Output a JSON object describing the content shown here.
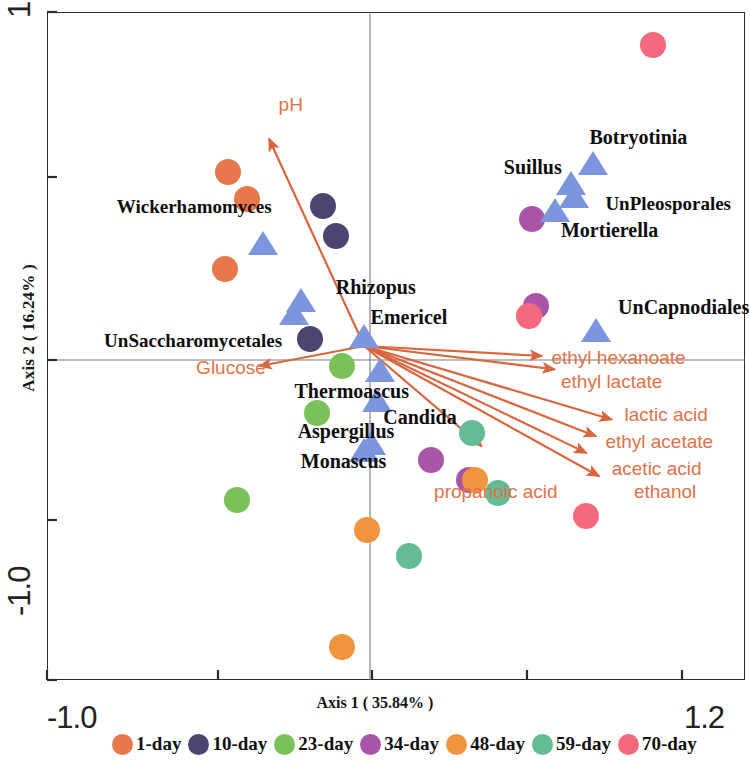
{
  "axes": {
    "x_title": "Axis 1 ( 35.84% )",
    "y_title": "Axis 2 ( 16.24% )",
    "x_min_label": "-1.0",
    "x_max_label": "1.2",
    "y_min_label": "-1.0",
    "y_max_label": "1.0"
  },
  "legend": {
    "items": [
      {
        "label": "1-day",
        "color": "#E8774B"
      },
      {
        "label": "10-day",
        "color": "#4C4471"
      },
      {
        "label": "23-day",
        "color": "#79C158"
      },
      {
        "label": "34-day",
        "color": "#A855A8"
      },
      {
        "label": "48-day",
        "color": "#F0943F"
      },
      {
        "label": "59-day",
        "color": "#63BC93"
      },
      {
        "label": "70-day",
        "color": "#F4697E"
      }
    ]
  },
  "chart_data": {
    "type": "scatter",
    "title": "",
    "xlabel": "Axis 1 ( 35.84% )",
    "ylabel": "Axis 2 ( 16.24% )",
    "xlim": [
      -1.0,
      1.2
    ],
    "ylim": [
      -1.0,
      1.0
    ],
    "grid": false,
    "legend_position": "bottom",
    "samples": [
      {
        "day": "1-day",
        "x": -0.43,
        "y": 0.52
      },
      {
        "day": "1-day",
        "x": -0.37,
        "y": 0.44
      },
      {
        "day": "1-day",
        "x": -0.44,
        "y": 0.23
      },
      {
        "day": "10-day",
        "x": -0.13,
        "y": 0.42
      },
      {
        "day": "10-day",
        "x": -0.09,
        "y": 0.33
      },
      {
        "day": "10-day",
        "x": -0.17,
        "y": 0.02
      },
      {
        "day": "23-day",
        "x": -0.07,
        "y": -0.06
      },
      {
        "day": "23-day",
        "x": -0.15,
        "y": -0.2
      },
      {
        "day": "23-day",
        "x": -0.4,
        "y": -0.46
      },
      {
        "day": "34-day",
        "x": 0.53,
        "y": 0.38
      },
      {
        "day": "34-day",
        "x": 0.54,
        "y": 0.12
      },
      {
        "day": "34-day",
        "x": 0.21,
        "y": -0.34
      },
      {
        "day": "34-day",
        "x": 0.33,
        "y": -0.4
      },
      {
        "day": "48-day",
        "x": 0.35,
        "y": -0.4
      },
      {
        "day": "48-day",
        "x": 0.01,
        "y": -0.55
      },
      {
        "day": "48-day",
        "x": -0.07,
        "y": -0.9
      },
      {
        "day": "59-day",
        "x": 0.34,
        "y": -0.26
      },
      {
        "day": "59-day",
        "x": 0.42,
        "y": -0.44
      },
      {
        "day": "59-day",
        "x": 0.14,
        "y": -0.63
      },
      {
        "day": "70-day",
        "x": 0.91,
        "y": 0.9
      },
      {
        "day": "70-day",
        "x": 0.52,
        "y": 0.09
      },
      {
        "day": "70-day",
        "x": 0.7,
        "y": -0.51
      }
    ],
    "taxa": [
      {
        "name": "Wickerhamomyces",
        "x": -0.32,
        "y": 0.3,
        "label_x": -0.78,
        "label_y": 0.41
      },
      {
        "name": "UnSaccharomycetales",
        "x": -0.22,
        "y": 0.09,
        "label_x": -0.82,
        "label_y": 0.01
      },
      {
        "name": "Rhizopus",
        "x": -0.2,
        "y": 0.13,
        "label_x": -0.09,
        "label_y": 0.17
      },
      {
        "name": "Emericel",
        "x": 0.0,
        "y": 0.02,
        "label_x": 0.02,
        "label_y": 0.08
      },
      {
        "name": "Thermoascus",
        "x": 0.05,
        "y": -0.08,
        "label_x": -0.22,
        "label_y": -0.14
      },
      {
        "name": "Candida",
        "x": 0.04,
        "y": -0.17,
        "label_x": 0.06,
        "label_y": -0.22
      },
      {
        "name": "Aspergillus",
        "x": 0.02,
        "y": -0.3,
        "label_x": -0.21,
        "label_y": -0.26
      },
      {
        "name": "Monascus",
        "x": 0.0,
        "y": -0.32,
        "label_x": -0.2,
        "label_y": -0.35
      },
      {
        "name": "Suillus",
        "x": 0.65,
        "y": 0.48,
        "label_x": 0.44,
        "label_y": 0.53
      },
      {
        "name": "Botryotinia",
        "x": 0.72,
        "y": 0.54,
        "label_x": 0.71,
        "label_y": 0.62
      },
      {
        "name": "UnPleosporales",
        "x": 0.66,
        "y": 0.44,
        "label_x": 0.76,
        "label_y": 0.42
      },
      {
        "name": "Mortierella",
        "x": 0.6,
        "y": 0.4,
        "label_x": 0.62,
        "label_y": 0.34
      },
      {
        "name": "UnCapnodiales",
        "x": 0.73,
        "y": 0.04,
        "label_x": 0.8,
        "label_y": 0.11
      }
    ],
    "vectors": [
      {
        "name": "pH",
        "x": -0.3,
        "y": 0.62,
        "label_x": -0.27,
        "label_y": 0.72
      },
      {
        "name": "Glucose",
        "x": -0.33,
        "y": -0.06,
        "label_x": -0.53,
        "label_y": -0.07
      },
      {
        "name": "ethyl hexanoate",
        "x": 0.56,
        "y": -0.03,
        "label_x": 0.59,
        "label_y": -0.04
      },
      {
        "name": "ethyl lactate",
        "x": 0.6,
        "y": -0.07,
        "label_x": 0.62,
        "label_y": -0.11
      },
      {
        "name": "lactic acid",
        "x": 0.78,
        "y": -0.22,
        "label_x": 0.82,
        "label_y": -0.21
      },
      {
        "name": "ethyl acetate",
        "x": 0.73,
        "y": -0.27,
        "label_x": 0.76,
        "label_y": -0.29
      },
      {
        "name": "acetic acid",
        "x": 0.7,
        "y": -0.32,
        "label_x": 0.78,
        "label_y": -0.37
      },
      {
        "name": "ethanol",
        "x": 0.74,
        "y": -0.39,
        "label_x": 0.85,
        "label_y": -0.44
      },
      {
        "name": "propanoic acid",
        "x": 0.37,
        "y": -0.3,
        "label_x": 0.22,
        "label_y": -0.44
      }
    ]
  }
}
